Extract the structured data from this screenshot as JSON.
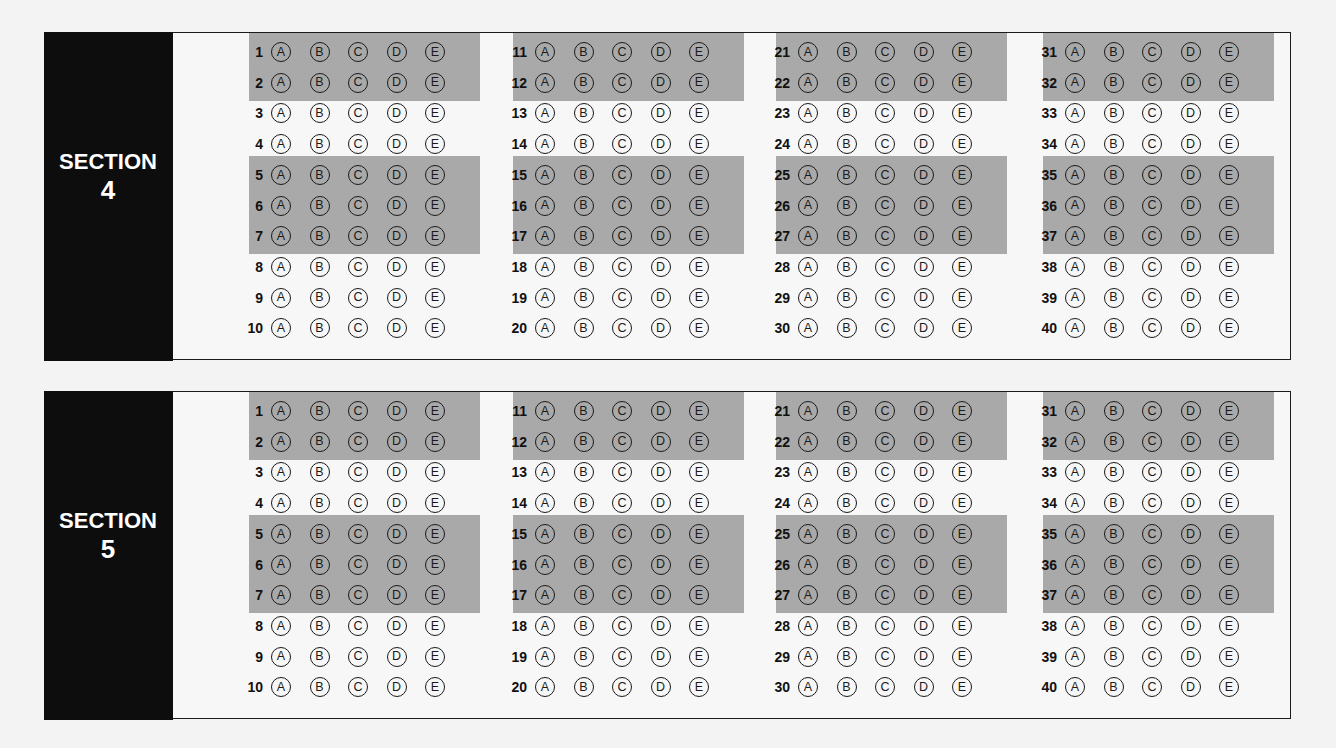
{
  "choices": [
    "A",
    "B",
    "C",
    "D",
    "E"
  ],
  "sections": [
    {
      "word": "SECTION",
      "number": "4",
      "columns": [
        {
          "questions": [
            "1",
            "2",
            "3",
            "4",
            "5",
            "6",
            "7",
            "8",
            "9",
            "10"
          ]
        },
        {
          "questions": [
            "11",
            "12",
            "13",
            "14",
            "15",
            "16",
            "17",
            "18",
            "19",
            "20"
          ]
        },
        {
          "questions": [
            "21",
            "22",
            "23",
            "24",
            "25",
            "26",
            "27",
            "28",
            "29",
            "30"
          ]
        },
        {
          "questions": [
            "31",
            "32",
            "33",
            "34",
            "35",
            "36",
            "37",
            "38",
            "39",
            "40"
          ]
        }
      ]
    },
    {
      "word": "SECTION",
      "number": "5",
      "columns": [
        {
          "questions": [
            "1",
            "2",
            "3",
            "4",
            "5",
            "6",
            "7",
            "8",
            "9",
            "10"
          ]
        },
        {
          "questions": [
            "11",
            "12",
            "13",
            "14",
            "15",
            "16",
            "17",
            "18",
            "19",
            "20"
          ]
        },
        {
          "questions": [
            "21",
            "22",
            "23",
            "24",
            "25",
            "26",
            "27",
            "28",
            "29",
            "30"
          ]
        },
        {
          "questions": [
            "31",
            "32",
            "33",
            "34",
            "35",
            "36",
            "37",
            "38",
            "39",
            "40"
          ]
        }
      ]
    }
  ],
  "shaded_row_groups": [
    [
      0,
      1
    ],
    [
      4,
      5,
      6
    ]
  ],
  "colors": {
    "band": "#a9a9a9",
    "panel": "#0d0d0d",
    "paper": "#f7f7f7"
  }
}
